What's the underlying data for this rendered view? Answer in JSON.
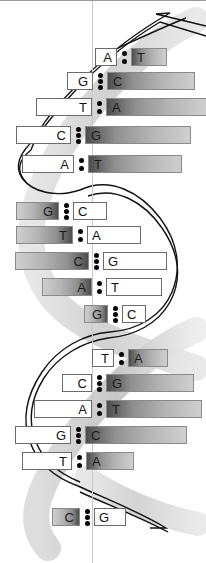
{
  "figure": {
    "width": 206,
    "height": 563,
    "background_color": "#ffffff"
  },
  "colors": {
    "backbone_outline": "#111111",
    "backbone_ribbon_light": "#d8d8d8",
    "backbone_ribbon_mid": "#bdbdbd",
    "nucleotide_shaded_dark": "#4d4d4d",
    "nucleotide_shaded_light": "#cfcfcf",
    "nucleotide_plain_fill": "#ffffff",
    "nucleotide_border": "#6b6b6b",
    "bond_dot": "#000000",
    "center_line": "#c9c9c9"
  },
  "legend": {
    "two_dot_meaning": "two hydrogen bonds (A-T)",
    "three_dot_meaning": "three hydrogen bonds (G-C)"
  },
  "base_pairs": [
    {
      "index": 1,
      "left": "A",
      "right": "T",
      "bonds": 2,
      "shaded_side": "right",
      "top": 48,
      "left_x": 95,
      "left_w": 22,
      "gap": 14,
      "right_w": 36
    },
    {
      "index": 2,
      "left": "G",
      "right": "C",
      "bonds": 3,
      "shaded_side": "right",
      "top": 72,
      "left_x": 67,
      "left_w": 26,
      "gap": 14,
      "right_w": 88
    },
    {
      "index": 3,
      "left": "T",
      "right": "A",
      "bonds": 2,
      "shaded_side": "right",
      "top": 98,
      "left_x": 36,
      "left_w": 56,
      "gap": 14,
      "right_w": 101
    },
    {
      "index": 4,
      "left": "C",
      "right": "G",
      "bonds": 3,
      "shaded_side": "right",
      "top": 126,
      "left_x": 16,
      "left_w": 55,
      "gap": 14,
      "right_w": 106
    },
    {
      "index": 5,
      "left": "A",
      "right": "T",
      "bonds": 2,
      "shaded_side": "right",
      "top": 155,
      "left_x": 22,
      "left_w": 52,
      "gap": 14,
      "right_w": 94
    },
    {
      "index": 6,
      "left": "G",
      "right": "C",
      "bonds": 3,
      "shaded_side": "left",
      "top": 202,
      "left_x": 16,
      "left_w": 43,
      "gap": 14,
      "right_w": 34
    },
    {
      "index": 7,
      "left": "T",
      "right": "A",
      "bonds": 2,
      "shaded_side": "left",
      "top": 226,
      "left_x": 16,
      "left_w": 57,
      "gap": 14,
      "right_w": 54
    },
    {
      "index": 8,
      "left": "C",
      "right": "G",
      "bonds": 3,
      "shaded_side": "left",
      "top": 252,
      "left_x": 15,
      "left_w": 74,
      "gap": 14,
      "right_w": 64
    },
    {
      "index": 9,
      "left": "A",
      "right": "T",
      "bonds": 2,
      "shaded_side": "left",
      "top": 278,
      "left_x": 42,
      "left_w": 50,
      "gap": 14,
      "right_w": 56
    },
    {
      "index": 10,
      "left": "G",
      "right": "C",
      "bonds": 3,
      "shaded_side": "left",
      "top": 305,
      "left_x": 84,
      "left_w": 24,
      "gap": 14,
      "right_w": 24
    },
    {
      "index": 11,
      "left": "T",
      "right": "A",
      "bonds": 2,
      "shaded_side": "right",
      "top": 349,
      "left_x": 92,
      "left_w": 22,
      "gap": 14,
      "right_w": 40
    },
    {
      "index": 12,
      "left": "C",
      "right": "G",
      "bonds": 3,
      "shaded_side": "right",
      "top": 374,
      "left_x": 62,
      "left_w": 30,
      "gap": 14,
      "right_w": 88
    },
    {
      "index": 13,
      "left": "A",
      "right": "T",
      "bonds": 2,
      "shaded_side": "right",
      "top": 400,
      "left_x": 34,
      "left_w": 58,
      "gap": 14,
      "right_w": 96
    },
    {
      "index": 14,
      "left": "G",
      "right": "C",
      "bonds": 3,
      "shaded_side": "right",
      "top": 426,
      "left_x": 15,
      "left_w": 56,
      "gap": 14,
      "right_w": 102
    },
    {
      "index": 15,
      "left": "T",
      "right": "A",
      "bonds": 2,
      "shaded_side": "right",
      "top": 452,
      "left_x": 22,
      "left_w": 50,
      "gap": 14,
      "right_w": 48
    },
    {
      "index": 16,
      "left": "C",
      "right": "G",
      "bonds": 3,
      "shaded_side": "left",
      "top": 508,
      "left_x": 52,
      "left_w": 28,
      "gap": 14,
      "right_w": 32
    }
  ],
  "strands": [
    {
      "name": "strand-left",
      "label": ""
    },
    {
      "name": "strand-right",
      "label": ""
    }
  ]
}
